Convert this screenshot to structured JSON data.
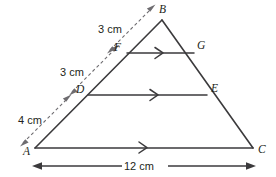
{
  "figure": {
    "type": "geometry-diagram",
    "shape": "triangle",
    "background_color": "#ffffff",
    "line_color": "#3b3a3c",
    "dimension_color": "#6e6c70"
  },
  "vertices": {
    "A": {
      "label": "A",
      "x": 35,
      "y": 148
    },
    "B": {
      "label": "B",
      "x": 162,
      "y": 20
    },
    "C": {
      "label": "C",
      "x": 253,
      "y": 148
    }
  },
  "points": {
    "D": {
      "label": "D",
      "x": 88,
      "y": 95
    },
    "E": {
      "label": "E",
      "x": 207,
      "y": 95
    },
    "F": {
      "label": "F",
      "x": 127,
      "y": 53
    },
    "G": {
      "label": "G",
      "x": 194,
      "y": 53
    }
  },
  "segments": [
    {
      "name": "AB",
      "from": "A",
      "to": "B"
    },
    {
      "name": "BC",
      "from": "B",
      "to": "C"
    },
    {
      "name": "AC",
      "from": "A",
      "to": "C",
      "marker": "single-chevron"
    },
    {
      "name": "DE",
      "from": "D",
      "to": "E",
      "marker": "single-chevron"
    },
    {
      "name": "FG",
      "from": "F",
      "to": "G",
      "marker": "single-chevron"
    }
  ],
  "measurements": {
    "ad": {
      "label": "4 cm",
      "applies_to": "A to D",
      "style": "dashed-double-arrow"
    },
    "df": {
      "label": "3 cm",
      "applies_to": "D to F",
      "style": "dashed-double-arrow"
    },
    "fb": {
      "label": "3 cm",
      "applies_to": "F to B",
      "style": "dashed-double-arrow"
    },
    "ac": {
      "label": "12 cm",
      "applies_to": "A to C",
      "style": "solid-double-arrow"
    }
  },
  "labels": {
    "A": "A",
    "B": "B",
    "C": "C",
    "D": "D",
    "E": "E",
    "F": "F",
    "G": "G",
    "dim_ad": "4 cm",
    "dim_df": "3 cm",
    "dim_fb": "3 cm",
    "dim_ac": "12 cm"
  }
}
